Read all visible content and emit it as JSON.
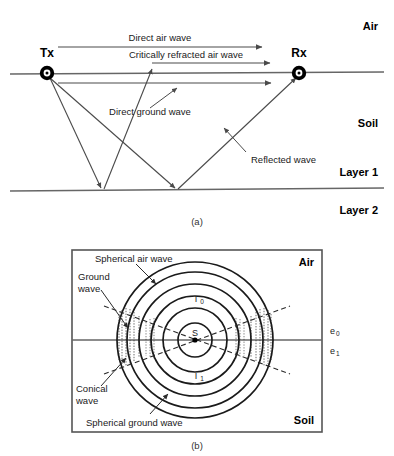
{
  "figure": {
    "panels": [
      {
        "id": "a",
        "caption": "(a)",
        "media_labels": {
          "air": "Air",
          "soil": "Soil",
          "layer1": "Layer 1",
          "layer2": "Layer 2"
        },
        "nodes": [
          {
            "name": "transmitter",
            "label": "Tx",
            "x": 47,
            "y": 73
          },
          {
            "name": "receiver",
            "label": "Rx",
            "x": 299,
            "y": 73
          }
        ],
        "wave_labels": [
          {
            "name": "direct-air-wave",
            "text": "Direct air wave"
          },
          {
            "name": "critically-refracted-air-wave",
            "text": "Critically refracted air wave"
          },
          {
            "name": "direct-ground-wave",
            "text": "Direct ground wave"
          },
          {
            "name": "reflected-wave",
            "text": "Reflected wave"
          }
        ],
        "interfaces": [
          {
            "name": "air-soil-interface",
            "y": 73
          },
          {
            "name": "layer1-layer2-interface",
            "y": 190
          }
        ]
      },
      {
        "id": "b",
        "caption": "(b)",
        "media_labels": {
          "air": "Air",
          "soil": "Soil"
        },
        "source_label": "S",
        "permittivity_labels": [
          {
            "name": "permittivity-air",
            "base": "e",
            "sub": "0"
          },
          {
            "name": "permittivity-soil",
            "base": "e",
            "sub": "1"
          }
        ],
        "wavefront_labels": [
          {
            "name": "intensity-air",
            "base": "I",
            "sub": "0"
          },
          {
            "name": "intensity-soil",
            "base": "I",
            "sub": "1"
          }
        ],
        "annotations": [
          {
            "name": "spherical-air-wave",
            "lines": [
              "Spherical air wave"
            ]
          },
          {
            "name": "ground-wave",
            "lines": [
              "Ground",
              "wave"
            ]
          },
          {
            "name": "conical-wave",
            "lines": [
              "Conical",
              "wave"
            ]
          },
          {
            "name": "spherical-ground-wave",
            "lines": [
              "Spherical ground wave"
            ]
          }
        ]
      }
    ]
  },
  "colors": {
    "line": "#555555",
    "ray": "#4a4a4a",
    "text": "#1a1a1a",
    "bold_text": "#000000",
    "box_border": "#555555",
    "dashed": "#3a3a3a"
  }
}
